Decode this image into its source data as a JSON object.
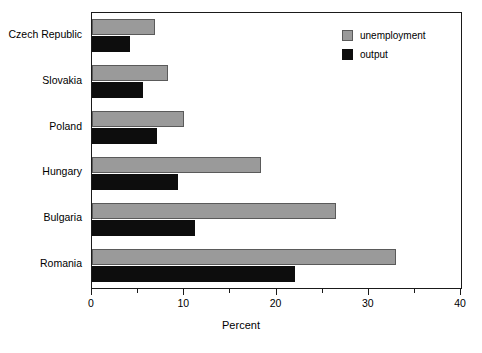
{
  "chart_data": {
    "type": "bar",
    "orientation": "horizontal",
    "title": "",
    "xlabel": "Percent",
    "ylabel": "",
    "xlim": [
      0,
      40
    ],
    "xticks": [
      0,
      10,
      20,
      30,
      40
    ],
    "xtick_labels": [
      "0",
      "10",
      "20",
      "30",
      "40"
    ],
    "xticks_minor": [
      5,
      15,
      25,
      35
    ],
    "grid": false,
    "legend_position": "top-right",
    "categories": [
      "Czech Republic",
      "Slovakia",
      "Poland",
      "Hungary",
      "Bulgaria",
      "Romania"
    ],
    "series": [
      {
        "name": "unemployment",
        "color": "#9a9a9a",
        "values": [
          6.8,
          8.2,
          10.0,
          18.3,
          26.5,
          33.0
        ]
      },
      {
        "name": "output",
        "color": "#0d0d0d",
        "values": [
          4.1,
          5.5,
          7.0,
          9.3,
          11.2,
          22.0
        ]
      }
    ]
  },
  "legend": {
    "items": [
      {
        "label": "unemployment",
        "color": "#9a9a9a"
      },
      {
        "label": "output",
        "color": "#0d0d0d"
      }
    ]
  },
  "axis": {
    "x_title": "Percent"
  }
}
